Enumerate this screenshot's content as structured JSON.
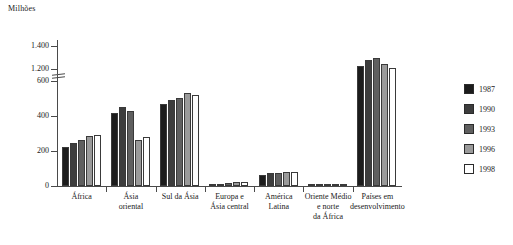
{
  "axis_unit_label": "Milhões",
  "chart_data": {
    "type": "bar",
    "title": "",
    "subtitle": "",
    "xlabel": "",
    "ylabel": "Milhões",
    "grid": false,
    "legend_position": "right",
    "axis_break": {
      "present": true,
      "lower_max": 600,
      "upper_min": 1200
    },
    "ylim": [
      0,
      1400
    ],
    "yticks": [
      "0",
      "200",
      "400",
      "600",
      "1.200",
      "1.400"
    ],
    "categories": [
      "África",
      "Ásia\noriental",
      "Sul da Ásia",
      "Europa e\nÁsia central",
      "América\nLatina",
      "Oriente Médio\ne norte\nda África",
      "Países em\ndesenvolvimento"
    ],
    "series": [
      {
        "name": "1987",
        "color": "#1c1c1c",
        "values": [
          225,
          420,
          470,
          6,
          62,
          10,
          1230
        ]
      },
      {
        "name": "1990",
        "color": "#3d3d3d",
        "values": [
          245,
          450,
          490,
          12,
          72,
          11,
          1280
        ]
      },
      {
        "name": "1993",
        "color": "#5f5f5f",
        "values": [
          265,
          430,
          505,
          18,
          75,
          11,
          1300
        ]
      },
      {
        "name": "1996",
        "color": "#9a9a9a",
        "values": [
          285,
          265,
          530,
          22,
          78,
          11,
          1240
        ]
      },
      {
        "name": "1998",
        "color": "#ffffff",
        "values": [
          290,
          280,
          522,
          24,
          78,
          11,
          1210
        ]
      }
    ]
  },
  "legend": {
    "items": [
      {
        "label": "1987",
        "color": "#1c1c1c"
      },
      {
        "label": "1990",
        "color": "#3d3d3d"
      },
      {
        "label": "1993",
        "color": "#5f5f5f"
      },
      {
        "label": "1996",
        "color": "#9a9a9a"
      },
      {
        "label": "1998",
        "color": "#ffffff"
      }
    ]
  }
}
